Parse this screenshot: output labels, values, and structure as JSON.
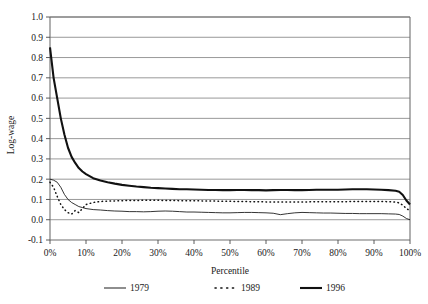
{
  "chart_data": {
    "type": "line",
    "title": "",
    "xlabel": "Percentile",
    "ylabel": "Log-wage",
    "xlim": [
      0,
      100
    ],
    "ylim": [
      -0.1,
      1.0
    ],
    "grid": true,
    "legend_position": "bottom",
    "y_ticks": [
      "1.0",
      "0.9",
      "0.8",
      "0.7",
      "0.6",
      "0.5",
      "0.4",
      "0.3",
      "0.2",
      "0.1",
      "0.0",
      "-0.1"
    ],
    "y_tick_values": [
      1.0,
      0.9,
      0.8,
      0.7,
      0.6,
      0.5,
      0.4,
      0.3,
      0.2,
      0.1,
      0.0,
      -0.1
    ],
    "x_ticks": [
      "0%",
      "10%",
      "20%",
      "30%",
      "40%",
      "50%",
      "60%",
      "70%",
      "80%",
      "90%",
      "100%"
    ],
    "x_tick_values": [
      0,
      10,
      20,
      30,
      40,
      50,
      60,
      70,
      80,
      90,
      100
    ],
    "x": [
      0,
      1,
      2,
      3,
      4,
      5,
      6,
      7,
      8,
      9,
      10,
      12,
      14,
      16,
      18,
      20,
      22,
      24,
      26,
      28,
      30,
      32,
      34,
      36,
      38,
      40,
      42,
      44,
      46,
      48,
      50,
      52,
      54,
      56,
      58,
      60,
      62,
      64,
      66,
      68,
      70,
      72,
      74,
      76,
      78,
      80,
      82,
      84,
      86,
      88,
      90,
      92,
      94,
      96,
      97,
      98,
      99,
      100
    ],
    "series": [
      {
        "name": "1979",
        "style": "thin-solid",
        "color": "#111111",
        "values": [
          0.2,
          0.195,
          0.185,
          0.16,
          0.125,
          0.1,
          0.085,
          0.075,
          0.065,
          0.06,
          0.055,
          0.05,
          0.048,
          0.045,
          0.043,
          0.042,
          0.04,
          0.04,
          0.039,
          0.04,
          0.042,
          0.043,
          0.042,
          0.04,
          0.038,
          0.038,
          0.037,
          0.036,
          0.035,
          0.034,
          0.034,
          0.035,
          0.036,
          0.036,
          0.035,
          0.034,
          0.032,
          0.025,
          0.03,
          0.034,
          0.036,
          0.035,
          0.034,
          0.033,
          0.033,
          0.032,
          0.031,
          0.031,
          0.03,
          0.03,
          0.03,
          0.03,
          0.029,
          0.028,
          0.026,
          0.018,
          0.006,
          0.0
        ]
      },
      {
        "name": "1989",
        "style": "dotted",
        "color": "#111111",
        "values": [
          0.185,
          0.16,
          0.115,
          0.075,
          0.05,
          0.035,
          0.028,
          0.045,
          0.035,
          0.055,
          0.075,
          0.085,
          0.09,
          0.092,
          0.093,
          0.094,
          0.095,
          0.095,
          0.096,
          0.096,
          0.096,
          0.095,
          0.095,
          0.094,
          0.094,
          0.093,
          0.093,
          0.092,
          0.092,
          0.091,
          0.091,
          0.09,
          0.09,
          0.089,
          0.089,
          0.088,
          0.088,
          0.088,
          0.088,
          0.088,
          0.088,
          0.088,
          0.089,
          0.089,
          0.089,
          0.089,
          0.089,
          0.09,
          0.09,
          0.09,
          0.09,
          0.09,
          0.089,
          0.087,
          0.083,
          0.072,
          0.055,
          0.045
        ]
      },
      {
        "name": "1996",
        "style": "thick-solid",
        "color": "#111111",
        "values": [
          0.85,
          0.7,
          0.6,
          0.5,
          0.42,
          0.355,
          0.31,
          0.28,
          0.255,
          0.238,
          0.225,
          0.205,
          0.193,
          0.185,
          0.178,
          0.172,
          0.168,
          0.164,
          0.161,
          0.158,
          0.156,
          0.154,
          0.152,
          0.15,
          0.15,
          0.149,
          0.148,
          0.147,
          0.147,
          0.146,
          0.146,
          0.147,
          0.147,
          0.146,
          0.146,
          0.145,
          0.146,
          0.147,
          0.147,
          0.146,
          0.146,
          0.147,
          0.148,
          0.148,
          0.148,
          0.148,
          0.149,
          0.15,
          0.15,
          0.15,
          0.149,
          0.148,
          0.146,
          0.143,
          0.138,
          0.122,
          0.095,
          0.075
        ]
      }
    ],
    "legend": [
      {
        "label": "1979",
        "marker": "thin-solid"
      },
      {
        "label": "1989",
        "marker": "dotted"
      },
      {
        "label": "1996",
        "marker": "thick-solid"
      }
    ]
  }
}
